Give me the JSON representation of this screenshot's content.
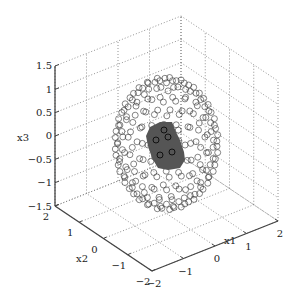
{
  "chart_data": {
    "type": "scatter",
    "subtype": "3d-scatter",
    "title": "",
    "xlabel": "x1",
    "ylabel": "x2",
    "zlabel": "x3",
    "xlim": [
      -2,
      2
    ],
    "ylim": [
      -2,
      2
    ],
    "zlim": [
      -1.5,
      1.5
    ],
    "xticks": [
      -2,
      -1,
      0,
      1,
      2
    ],
    "yticks": [
      -2,
      -1,
      0,
      1,
      2
    ],
    "zticks": [
      -1.5,
      -1,
      -0.5,
      0,
      0.5,
      1,
      1.5
    ],
    "xtick_labels": [
      "−2",
      "−1",
      "0",
      "1",
      "2"
    ],
    "ytick_labels": [
      "−2",
      "−1",
      "0",
      "1",
      "2"
    ],
    "ztick_labels": [
      "−1.5",
      "−1",
      "−0.5",
      "0",
      "0.5",
      "1",
      "1.5"
    ],
    "grid": true,
    "series": [
      {
        "name": "sphere-points",
        "marker": "open-circle",
        "color": "#333333",
        "shape": "sphere",
        "center": [
          0,
          0,
          0
        ],
        "radius": 1.3,
        "latitude_rings": 13,
        "points_per_ring_max": 26
      },
      {
        "name": "highlighted-region",
        "marker": "filled-patch",
        "color": "#555555",
        "description": "dark shaded cluster on sphere surface facing viewer",
        "approx_center": [
          -0.3,
          -0.6,
          0.1
        ]
      }
    ],
    "legend": "none"
  }
}
